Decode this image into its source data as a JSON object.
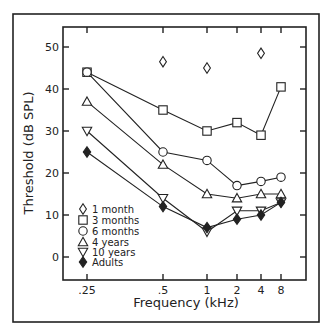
{
  "chart_data": {
    "type": "line",
    "title": "",
    "xlabel": "Frequency (kHz)",
    "ylabel": "Threshold (dB SPL)",
    "x_scale": "log",
    "categories": [
      ".25",
      ".5",
      "1",
      "2",
      "4",
      "8"
    ],
    "x": [
      0.25,
      0.5,
      1,
      2,
      4,
      8
    ],
    "ylim": [
      -5,
      55
    ],
    "y_ticks": [
      0,
      10,
      20,
      30,
      40,
      50
    ],
    "grid": false,
    "legend_position": "lower left (inside plot)",
    "series": [
      {
        "name": "1 month",
        "marker": "open-diamond",
        "connected": false,
        "values": [
          null,
          46.5,
          45,
          null,
          48.5,
          null
        ]
      },
      {
        "name": "3 months",
        "marker": "open-square",
        "connected": true,
        "values": [
          44,
          35,
          30,
          32,
          29,
          40.5
        ]
      },
      {
        "name": "6 months",
        "marker": "open-circle",
        "connected": true,
        "values": [
          44,
          25,
          23,
          17,
          18,
          19
        ]
      },
      {
        "name": "4 years",
        "marker": "open-triangle-up",
        "connected": true,
        "values": [
          37,
          22,
          15,
          14,
          15,
          15
        ]
      },
      {
        "name": "10 years",
        "marker": "open-triangle-down",
        "connected": true,
        "values": [
          30,
          14,
          6,
          11,
          11,
          13
        ]
      },
      {
        "name": "Adults",
        "marker": "filled-diamond",
        "connected": true,
        "values": [
          25,
          12,
          7,
          9,
          10,
          13
        ]
      }
    ]
  },
  "layout": {
    "frame": {
      "x1": 13,
      "y1": 14,
      "x2": 319,
      "y2": 322
    },
    "plot": {
      "x1": 63,
      "y1": 27,
      "x2": 306,
      "y2": 280
    },
    "x_pixels": [
      87,
      163,
      207,
      237,
      261,
      281
    ],
    "y0_pixel": 257,
    "px_per_db": 4.2,
    "legend": {
      "symbol_x": 83,
      "text_x": 92,
      "row_y": [
        209,
        220,
        231,
        242,
        252,
        262
      ]
    },
    "colors": {
      "ink": "#222222",
      "background": "#ffffff"
    }
  }
}
